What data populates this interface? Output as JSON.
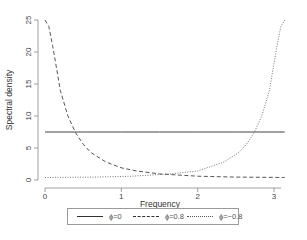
{
  "chart_data": {
    "type": "line",
    "title": "",
    "xlabel": "Frequency",
    "ylabel": "Spectral density",
    "xlim": [
      0,
      3.14159
    ],
    "ylim": [
      0,
      25
    ],
    "xticks": [
      0,
      1,
      2,
      3
    ],
    "yticks": [
      0,
      5,
      10,
      15,
      20,
      25
    ],
    "grid": false,
    "legend_position": "bottom",
    "series": [
      {
        "name": "ϕ=0",
        "style": "solid",
        "x": [
          0,
          0.5,
          1,
          1.5,
          2,
          2.5,
          3,
          3.14
        ],
        "values": [
          7.5,
          7.5,
          7.5,
          7.5,
          7.5,
          7.5,
          7.5,
          7.5
        ]
      },
      {
        "name": "ϕ=0.8",
        "style": "dashed",
        "x": [
          0,
          0.05,
          0.1,
          0.15,
          0.2,
          0.3,
          0.4,
          0.5,
          0.6,
          0.8,
          1.0,
          1.2,
          1.5,
          2.0,
          2.5,
          3.0,
          3.14
        ],
        "values": [
          25,
          24,
          21,
          17.5,
          14,
          10,
          7.4,
          5.6,
          4.3,
          2.8,
          1.9,
          1.4,
          0.95,
          0.6,
          0.45,
          0.4,
          0.39
        ]
      },
      {
        "name": "ϕ=−0.8",
        "style": "dotted",
        "x": [
          0,
          0.14,
          0.64,
          1.14,
          1.64,
          2.0,
          2.34,
          2.54,
          2.64,
          2.74,
          2.84,
          2.94,
          2.99,
          3.04,
          3.09,
          3.14
        ],
        "values": [
          0.39,
          0.4,
          0.45,
          0.6,
          0.95,
          1.4,
          2.8,
          4.3,
          5.6,
          7.4,
          10,
          14,
          17.5,
          21,
          24,
          25
        ]
      }
    ]
  },
  "axes": {
    "xlabel": "Frequency",
    "ylabel": "Spectral density",
    "xtick_labels": [
      "0",
      "1",
      "2",
      "3"
    ],
    "ytick_labels": [
      "0",
      "5",
      "10",
      "15",
      "20",
      "25"
    ]
  },
  "legend": {
    "items": [
      {
        "label": "ϕ=0",
        "style": "solid"
      },
      {
        "label": "ϕ=0.8",
        "style": "dashed"
      },
      {
        "label": "ϕ=−0.8",
        "style": "dotted"
      }
    ]
  }
}
